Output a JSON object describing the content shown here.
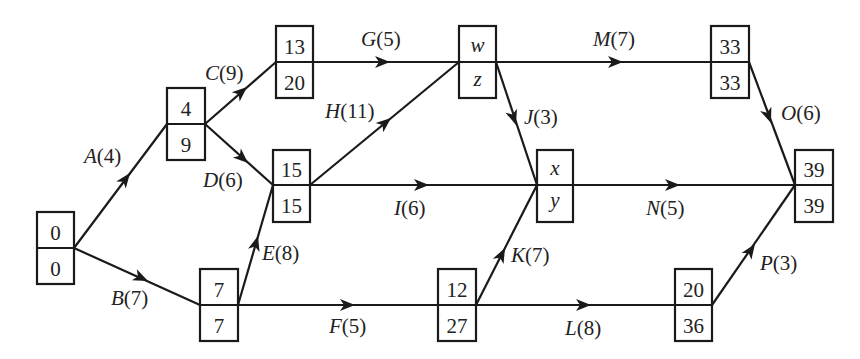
{
  "nodes": [
    {
      "id": "n0",
      "top": "0",
      "bottom": "0",
      "top_var": false,
      "bottom_var": false
    },
    {
      "id": "n1",
      "top": "4",
      "bottom": "9",
      "top_var": false,
      "bottom_var": false
    },
    {
      "id": "n2",
      "top": "13",
      "bottom": "20",
      "top_var": false,
      "bottom_var": false
    },
    {
      "id": "n3",
      "top": "15",
      "bottom": "15",
      "top_var": false,
      "bottom_var": false
    },
    {
      "id": "n4",
      "top": "7",
      "bottom": "7",
      "top_var": false,
      "bottom_var": false
    },
    {
      "id": "n5",
      "top": "w",
      "bottom": "z",
      "top_var": true,
      "bottom_var": true
    },
    {
      "id": "n6",
      "top": "x",
      "bottom": "y",
      "top_var": true,
      "bottom_var": true
    },
    {
      "id": "n7",
      "top": "12",
      "bottom": "27",
      "top_var": false,
      "bottom_var": false
    },
    {
      "id": "n8",
      "top": "33",
      "bottom": "33",
      "top_var": false,
      "bottom_var": false
    },
    {
      "id": "n9",
      "top": "20",
      "bottom": "36",
      "top_var": false,
      "bottom_var": false
    },
    {
      "id": "n10",
      "top": "39",
      "bottom": "39",
      "top_var": false,
      "bottom_var": false
    }
  ],
  "activities": [
    {
      "from": "n0",
      "to": "n1",
      "name": "A",
      "duration": "4",
      "label": "A(4)"
    },
    {
      "from": "n0",
      "to": "n4",
      "name": "B",
      "duration": "7",
      "label": "B(7)"
    },
    {
      "from": "n1",
      "to": "n2",
      "name": "C",
      "duration": "9",
      "label": "C(9)"
    },
    {
      "from": "n1",
      "to": "n3",
      "name": "D",
      "duration": "6",
      "label": "D(6)"
    },
    {
      "from": "n4",
      "to": "n3",
      "name": "E",
      "duration": "8",
      "label": "E(8)"
    },
    {
      "from": "n4",
      "to": "n7",
      "name": "F",
      "duration": "5",
      "label": "F(5)"
    },
    {
      "from": "n2",
      "to": "n5",
      "name": "G",
      "duration": "5",
      "label": "G(5)"
    },
    {
      "from": "n3",
      "to": "n5",
      "name": "H",
      "duration": "11",
      "label": "H(11)"
    },
    {
      "from": "n3",
      "to": "n6",
      "name": "I",
      "duration": "6",
      "label": "I(6)"
    },
    {
      "from": "n5",
      "to": "n6",
      "name": "J",
      "duration": "3",
      "label": "J(3)"
    },
    {
      "from": "n7",
      "to": "n6",
      "name": "K",
      "duration": "7",
      "label": "K(7)"
    },
    {
      "from": "n7",
      "to": "n9",
      "name": "L",
      "duration": "8",
      "label": "L(8)"
    },
    {
      "from": "n5",
      "to": "n8",
      "name": "M",
      "duration": "7",
      "label": "M(7)"
    },
    {
      "from": "n6",
      "to": "n10",
      "name": "N",
      "duration": "5",
      "label": "N(5)"
    },
    {
      "from": "n8",
      "to": "n10",
      "name": "O",
      "duration": "6",
      "label": "O(6)"
    },
    {
      "from": "n9",
      "to": "n10",
      "name": "P",
      "duration": "3",
      "label": "P(3)"
    }
  ]
}
